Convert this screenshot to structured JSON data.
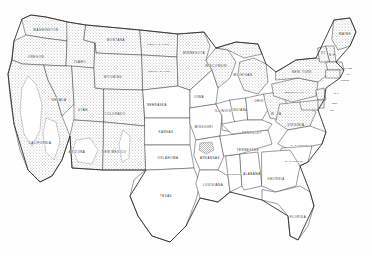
{
  "map": {
    "title": "Map of the United States",
    "kind": "choropleth-relief",
    "background_color": "#ffffff",
    "outline_color": "#2e2e2e",
    "border_color": "#4a4a4a",
    "shading_color": "#9a9a9a",
    "shading_meaning": "stippled / hatched relief shading",
    "label_color": "#2b2b2b",
    "projection_note": "conterminous united states",
    "legend": null,
    "states": [
      {
        "id": "WA",
        "label": "WASHINGTON",
        "shaded": true,
        "x": 46,
        "y": 30
      },
      {
        "id": "OR",
        "label": "OREGON",
        "shaded": true,
        "x": 36,
        "y": 57
      },
      {
        "id": "CA",
        "label": "CALIFORNIA",
        "shaded": true,
        "x": 40,
        "y": 143
      },
      {
        "id": "ID",
        "label": "IDAHO",
        "shaded": true,
        "x": 80,
        "y": 62
      },
      {
        "id": "NV",
        "label": "NEVADA",
        "shaded": true,
        "x": 59,
        "y": 100
      },
      {
        "id": "UT",
        "label": "UTAH",
        "shaded": true,
        "x": 83,
        "y": 110
      },
      {
        "id": "AZ",
        "label": "ARIZONA",
        "shaded": true,
        "x": 77,
        "y": 152
      },
      {
        "id": "MT",
        "label": "MONTANA",
        "shaded": true,
        "x": 116,
        "y": 40
      },
      {
        "id": "WY",
        "label": "WYOMING",
        "shaded": true,
        "x": 113,
        "y": 77
      },
      {
        "id": "CO",
        "label": "COLORADO",
        "shaded": true,
        "x": 115,
        "y": 114
      },
      {
        "id": "NM",
        "label": "NEW MEXICO",
        "shaded": true,
        "x": 114,
        "y": 152
      },
      {
        "id": "ND",
        "label": "NORTH DAKOTA",
        "shaded": true,
        "x": 159,
        "y": 44
      },
      {
        "id": "SD",
        "label": "SOUTH DAKOTA",
        "shaded": true,
        "x": 160,
        "y": 71
      },
      {
        "id": "NE",
        "label": "NEBRASKA",
        "shaded": false,
        "x": 157,
        "y": 105
      },
      {
        "id": "KS",
        "label": "KANSAS",
        "shaded": false,
        "x": 166,
        "y": 132
      },
      {
        "id": "OK",
        "label": "OKLAHOMA",
        "shaded": false,
        "x": 168,
        "y": 158
      },
      {
        "id": "TX",
        "label": "TEXAS",
        "shaded": false,
        "x": 166,
        "y": 196
      },
      {
        "id": "MN",
        "label": "MINNESOTA",
        "shaded": true,
        "x": 194,
        "y": 53
      },
      {
        "id": "IA",
        "label": "IOWA",
        "shaded": false,
        "x": 199,
        "y": 97
      },
      {
        "id": "MO",
        "label": "MISSOURI",
        "shaded": false,
        "x": 204,
        "y": 127
      },
      {
        "id": "AR",
        "label": "ARKANSAS",
        "shaded": false,
        "x": 210,
        "y": 158
      },
      {
        "id": "LA",
        "label": "LOUISIANA",
        "shaded": false,
        "x": 213,
        "y": 185
      },
      {
        "id": "WI",
        "label": "WISCONSIN",
        "shaded": true,
        "x": 216,
        "y": 66
      },
      {
        "id": "IL",
        "label": "ILLINOIS",
        "shaded": false,
        "x": 223,
        "y": 111
      },
      {
        "id": "MS",
        "label": "MISSISSIPPI",
        "shaded": false,
        "x": 233,
        "y": 174
      },
      {
        "id": "MI",
        "label": "MICHIGAN",
        "shaded": true,
        "x": 243,
        "y": 75
      },
      {
        "id": "IN",
        "label": "INDIANA",
        "shaded": false,
        "x": 240,
        "y": 110
      },
      {
        "id": "TN",
        "label": "TENNESSEE",
        "shaded": false,
        "x": 248,
        "y": 150
      },
      {
        "id": "AL",
        "label": "ALABAMA",
        "shaded": false,
        "x": 252,
        "y": 174
      },
      {
        "id": "KY",
        "label": "KENTUCKY",
        "shaded": false,
        "x": 252,
        "y": 133
      },
      {
        "id": "OH",
        "label": "OHIO",
        "shaded": false,
        "x": 259,
        "y": 101
      },
      {
        "id": "GA",
        "label": "GEORGIA",
        "shaded": false,
        "x": 276,
        "y": 179
      },
      {
        "id": "FL",
        "label": "FLORIDA",
        "shaded": false,
        "x": 298,
        "y": 217
      },
      {
        "id": "SC",
        "label": "S. CAROLINA",
        "shaded": false,
        "x": 295,
        "y": 161
      },
      {
        "id": "NC",
        "label": "N. CAROLINA",
        "shaded": false,
        "x": 300,
        "y": 145
      },
      {
        "id": "WV",
        "label": "W. VA.",
        "shaded": true,
        "x": 277,
        "y": 114
      },
      {
        "id": "VA",
        "label": "VIRGINIA",
        "shaded": true,
        "x": 296,
        "y": 125
      },
      {
        "id": "PA",
        "label": "PENNSYLVANIA",
        "shaded": true,
        "x": 295,
        "y": 92
      },
      {
        "id": "NY",
        "label": "NEW YORK",
        "shaded": true,
        "x": 302,
        "y": 72
      },
      {
        "id": "ME",
        "label": "MAINE",
        "shaded": true,
        "x": 345,
        "y": 34
      },
      {
        "id": "VT",
        "label": "VT.",
        "shaded": true,
        "x": 324,
        "y": 53
      },
      {
        "id": "NH",
        "label": "N.H.",
        "shaded": true,
        "x": 333,
        "y": 55
      }
    ],
    "edge_labels": [
      {
        "id": "MA",
        "label": "MASS.",
        "x": 344,
        "y": 68
      },
      {
        "id": "RI",
        "label": "R.I.",
        "x": 347,
        "y": 74
      },
      {
        "id": "CT",
        "label": "CONN.",
        "x": 341,
        "y": 80
      },
      {
        "id": "NJ",
        "label": "N.J.",
        "x": 334,
        "y": 93
      },
      {
        "id": "DE",
        "label": "DEL.",
        "x": 332,
        "y": 103
      },
      {
        "id": "MD",
        "label": "MD.",
        "x": 330,
        "y": 110
      }
    ]
  }
}
